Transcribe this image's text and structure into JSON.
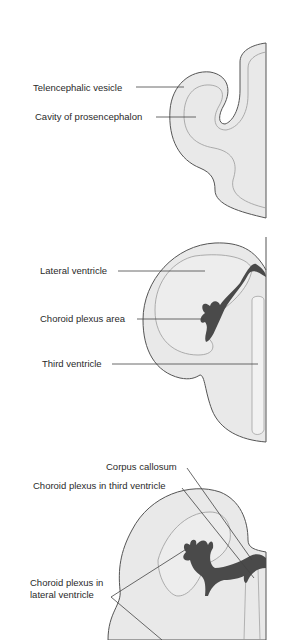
{
  "diagram": {
    "panels": [
      {
        "id": "stage1",
        "labels": [
          {
            "text": "Telencephalic vesicle"
          },
          {
            "text": "Cavity of prosencephalon"
          }
        ]
      },
      {
        "id": "stage2",
        "labels": [
          {
            "text": "Lateral ventricle"
          },
          {
            "text": "Choroid plexus area"
          },
          {
            "text": "Third ventricle"
          }
        ]
      },
      {
        "id": "stage3",
        "labels": [
          {
            "text": "Corpus callosum"
          },
          {
            "text": "Choroid plexus in third ventricle"
          },
          {
            "text": "Choroid plexus in"
          },
          {
            "text": "lateral ventricle"
          }
        ]
      }
    ],
    "colors": {
      "tissue_fill": "#e9e9e9",
      "outline": "#555555",
      "inner_line": "#9a9a9a",
      "choroid_plexus": "#4a4a4a",
      "leader_line": "#444444",
      "background": "#ffffff"
    }
  }
}
